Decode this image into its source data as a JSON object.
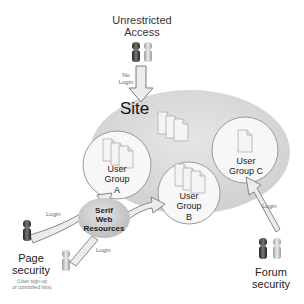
{
  "diagram": {
    "unrestricted": {
      "line1": "Unrestricted",
      "line2": "Access",
      "arrow_label_1": "No",
      "arrow_label_2": "Login"
    },
    "site": {
      "label": "Site"
    },
    "groups": [
      {
        "line1": "User",
        "line2": "Group",
        "line3": "A"
      },
      {
        "line1": "User",
        "line2": "Group",
        "line3": "B"
      },
      {
        "line1": "User",
        "line2": "Group C"
      }
    ],
    "resources": {
      "line1": "Serif",
      "line2": "Web",
      "line3": "Resources"
    },
    "page_security": {
      "line1": "Page",
      "line2": "security",
      "note1": "(User sign-up",
      "note2": "or controlled lists)",
      "login_1": "Login",
      "login_2": "Login"
    },
    "forum_security": {
      "line1": "Forum",
      "line2": "security",
      "login": "Login"
    },
    "colors": {
      "site_fill": "#dcdcdc",
      "circle_fill": "#f7f7f7",
      "circle_stroke": "#9a9a9a",
      "arrow_fill": "#e8e8e8",
      "arrow_stroke": "#7a7a7a"
    }
  }
}
